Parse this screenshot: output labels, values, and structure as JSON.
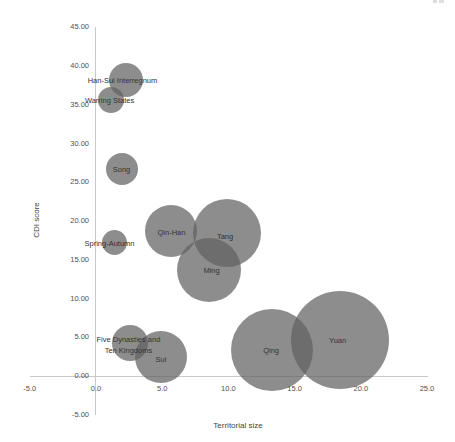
{
  "page": {
    "background": "#ffffff"
  },
  "chart_data": {
    "type": "scatter",
    "variant": "bubble",
    "title": "",
    "xlabel": "Territorial size",
    "ylabel": "CDI score",
    "xlim": [
      -5.0,
      25.0
    ],
    "ylim": [
      -5.0,
      45.0
    ],
    "grid": false,
    "legend": "none",
    "bubble_color": "rgba(97,97,97,0.72)",
    "axis_line_color": "#c9c9c9",
    "x_ticks": [
      {
        "value": -5,
        "label": "-5.0"
      },
      {
        "value": 0,
        "label": "0.0"
      },
      {
        "value": 5,
        "label": "5.0"
      },
      {
        "value": 10,
        "label": "10.0"
      },
      {
        "value": 15,
        "label": "15.0"
      },
      {
        "value": 20,
        "label": "20.0"
      },
      {
        "value": 25,
        "label": "25.0"
      }
    ],
    "y_ticks": [
      {
        "value": 45,
        "label": "45.00"
      },
      {
        "value": 40,
        "label": "40.00"
      },
      {
        "value": 35,
        "label": "35.00"
      },
      {
        "value": 30,
        "label": "30.00"
      },
      {
        "value": 25,
        "label": "25.00"
      },
      {
        "value": 20,
        "label": "20.00"
      },
      {
        "value": 15,
        "label": "15.00"
      },
      {
        "value": 10,
        "label": "10.00"
      },
      {
        "value": 5,
        "label": "5.00"
      },
      {
        "value": 0,
        "label": "0.00"
      },
      {
        "value": -5,
        "label": "-5.00"
      }
    ],
    "points": [
      {
        "label": "Han-Sui Interregnum",
        "x": 2.3,
        "y": 38.2,
        "r_px": 17,
        "label_dx": -4,
        "label_dy": 0
      },
      {
        "label": "Warring States",
        "x": 1.1,
        "y": 35.6,
        "r_px": 13,
        "label_dx": -1,
        "label_dy": 0
      },
      {
        "label": "Song",
        "x": 2.0,
        "y": 26.7,
        "r_px": 16,
        "label_dx": -1,
        "label_dy": 0
      },
      {
        "label": "Spring-Autumn",
        "x": 1.4,
        "y": 17.2,
        "r_px": 12.5,
        "label_dx": -5,
        "label_dy": 0
      },
      {
        "label": "Qin-Han",
        "x": 5.7,
        "y": 18.7,
        "r_px": 26,
        "label_dx": 0,
        "label_dy": 1
      },
      {
        "label": "Tang",
        "x": 9.9,
        "y": 18.5,
        "r_px": 34,
        "label_dx": -2,
        "label_dy": 3
      },
      {
        "label": "Ming",
        "x": 8.5,
        "y": 13.7,
        "r_px": 32,
        "label_dx": 3,
        "label_dy": 0
      },
      {
        "label": "Five Dynasties and\nTen Kingdoms",
        "x": 2.6,
        "y": 4.3,
        "r_px": 18,
        "label_dx": -2,
        "label_dy": 2
      },
      {
        "label": "Sui",
        "x": 4.9,
        "y": 2.5,
        "r_px": 26,
        "label_dx": 0,
        "label_dy": 2
      },
      {
        "label": "Qing",
        "x": 13.3,
        "y": 3.4,
        "r_px": 41,
        "label_dx": -1,
        "label_dy": 0
      },
      {
        "label": "Yuan",
        "x": 18.4,
        "y": 4.6,
        "r_px": 49,
        "label_dx": -2,
        "label_dy": 0
      }
    ]
  }
}
